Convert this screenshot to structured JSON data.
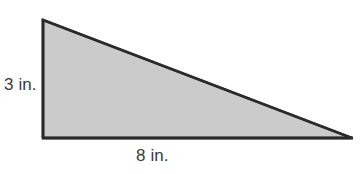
{
  "figure": {
    "name": "right-triangle-diagram",
    "type": "right triangle",
    "background_color": "#ffffff",
    "fill_color": "#cbcbcb",
    "stroke_color": "#2b2b2b",
    "stroke_width": 2.6,
    "vertices": {
      "apex": {
        "x": 43,
        "y": 20
      },
      "bottom_left": {
        "x": 43,
        "y": 138
      },
      "bottom_right": {
        "x": 352,
        "y": 138
      }
    },
    "labels": {
      "height": "3 in.",
      "base": "8 in."
    },
    "measurements": {
      "height_value": 3,
      "base_value": 8,
      "units": "in."
    }
  }
}
